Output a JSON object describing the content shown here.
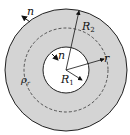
{
  "diagram": {
    "colors": {
      "annulus_fill": "#d4d4d4",
      "stroke": "#222222",
      "inner_fill": "#ffffff"
    },
    "labels": {
      "outer_normal": "n",
      "inner_normal": "n",
      "outer_radius": "R",
      "outer_radius_sub": "2",
      "inner_radius": "R",
      "inner_radius_sub": "1",
      "radius_var": "r",
      "density": "ρ",
      "density_sub": "r"
    }
  }
}
